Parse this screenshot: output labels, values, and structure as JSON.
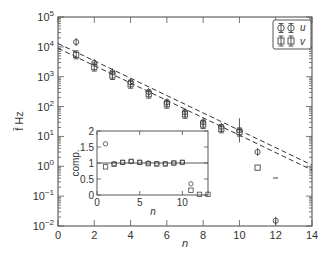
{
  "chart_data": [
    {
      "type": "scatter",
      "title": "",
      "xlabel": "n",
      "ylabel": "f̄ Hz",
      "xlim": [
        0,
        14
      ],
      "ylim": [
        0.01,
        100000
      ],
      "yscale": "log",
      "grid": false,
      "legend_position": "upper right",
      "x_ticks": [
        "0",
        "2",
        "4",
        "6",
        "8",
        "10",
        "12",
        "14"
      ],
      "y_ticks": [
        "10^-2",
        "10^-1",
        "10^0",
        "10^1",
        "10^2",
        "10^3",
        "10^4",
        "10^5"
      ],
      "series": [
        {
          "name": "u",
          "marker": "circle with error bar",
          "x": [
            1,
            2,
            3,
            4,
            5,
            6,
            7,
            8,
            9,
            10,
            11,
            12
          ],
          "y": [
            14500,
            2900,
            1400,
            650,
            310,
            140,
            65,
            30,
            21,
            16,
            3.0,
            0.015
          ]
        },
        {
          "name": "v",
          "marker": "square with error bar",
          "x": [
            1,
            2,
            3,
            4,
            5,
            6,
            7,
            8,
            9,
            10,
            11
          ],
          "y": [
            5400,
            2100,
            1100,
            560,
            260,
            120,
            55,
            25,
            18,
            14,
            0.9
          ]
        },
        {
          "name": "fit-upper",
          "style": "dashed line",
          "x": [
            0,
            14
          ],
          "y": [
            13000,
            1.1
          ]
        },
        {
          "name": "fit-lower",
          "style": "dashed line",
          "x": [
            0,
            14
          ],
          "y": [
            9000,
            0.75
          ]
        }
      ],
      "annotations": [
        "isolated short dash near n=12, f≈0.3"
      ]
    },
    {
      "type": "scatter",
      "title": "inset",
      "xlabel": "n",
      "ylabel": "comp.",
      "xlim": [
        0,
        13
      ],
      "ylim": [
        0,
        2
      ],
      "x_ticks": [
        "0",
        "5",
        "10"
      ],
      "y_ticks": [
        "0",
        "0.5",
        "1",
        "1.5",
        "2"
      ],
      "reference_line": 1,
      "series": [
        {
          "name": "u",
          "marker": "circle",
          "x": [
            1,
            2,
            3,
            4,
            5,
            6,
            7,
            8,
            9,
            10,
            11
          ],
          "y": [
            1.6,
            0.98,
            1.02,
            1.05,
            1.02,
            1.0,
            0.98,
            0.98,
            1.0,
            1.02,
            0.35
          ]
        },
        {
          "name": "v",
          "marker": "square",
          "x": [
            1,
            2,
            3,
            4,
            5,
            6,
            7,
            8,
            9,
            10,
            11,
            12,
            13
          ],
          "y": [
            0.88,
            0.96,
            1.02,
            1.05,
            1.02,
            0.98,
            0.97,
            0.97,
            1.0,
            1.02,
            0.15,
            0.02,
            0.02
          ]
        }
      ]
    }
  ],
  "labels": {
    "xlabel": "n",
    "ylabel": "f̄ Hz",
    "inset_xlabel": "n",
    "inset_ylabel": "comp.",
    "legend_u": "u",
    "legend_v": "v"
  },
  "ticks": {
    "x": [
      "0",
      "2",
      "4",
      "6",
      "8",
      "10",
      "12",
      "14"
    ],
    "y_base": [
      "10",
      "10",
      "10",
      "10",
      "10",
      "10",
      "10",
      "10"
    ],
    "y_exp": [
      "−2",
      "−1",
      "0",
      "1",
      "2",
      "3",
      "4",
      "5"
    ],
    "inset_x": [
      "0",
      "5",
      "10"
    ],
    "inset_y": [
      "0",
      "0.5",
      "1",
      "1.5",
      "2"
    ]
  }
}
